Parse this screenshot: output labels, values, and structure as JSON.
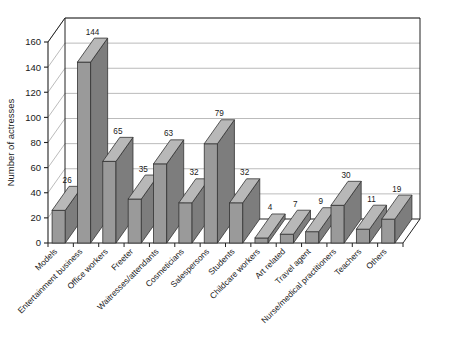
{
  "chart_data": {
    "type": "bar",
    "title": "",
    "subtitle": "",
    "xlabel": "",
    "ylabel": "Number of actresses",
    "ylim": [
      0,
      160
    ],
    "ytick_step": 20,
    "yticks": [
      0,
      20,
      40,
      60,
      80,
      100,
      120,
      140,
      160
    ],
    "ytick_labels": [
      "0",
      "20",
      "40",
      "60",
      "80",
      "100",
      "120",
      "140",
      "160"
    ],
    "grid": true,
    "grid_axis": "y",
    "legend": false,
    "legend_position": "none",
    "style": "3d-bar",
    "bar_face_color": "#9a9a9a",
    "bar_side_color": "#7d7d7d",
    "bar_top_color": "#b8b8b8",
    "bar_edge_color": "#333333",
    "axis_color": "#222222",
    "grid_color": "#aaaaaa",
    "categories": [
      "Models",
      "Entertainment business",
      "Office workers",
      "Freeter",
      "Waitresses/attendants",
      "Cosmeticians",
      "Salespersons",
      "Students",
      "Childcare workers",
      "Art related",
      "Travel agent",
      "Nurse/medical practitioners",
      "Teachers",
      "Others"
    ],
    "values": [
      26,
      144,
      65,
      35,
      63,
      32,
      79,
      32,
      4,
      7,
      9,
      30,
      11,
      19
    ],
    "data_labels": [
      "26",
      "144",
      "65",
      "35",
      "63",
      "32",
      "79",
      "32",
      "4",
      "7",
      "9",
      "30",
      "11",
      "19"
    ]
  }
}
